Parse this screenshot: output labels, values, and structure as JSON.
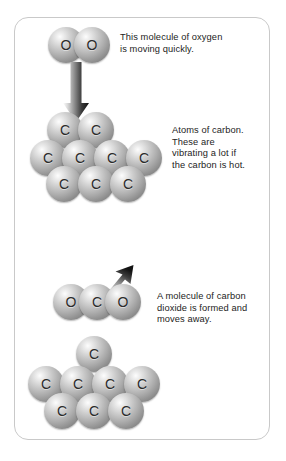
{
  "diagram": {
    "frame_color": "#c9c9c9",
    "background_color": "#ffffff",
    "atom_label_color": "#2b2b2b",
    "text_color": "#232323"
  },
  "captions": {
    "oxygen": "This molecule of oxygen\nis moving quickly.",
    "carbon": "Atoms of carbon.\nThese are\nvibrating a lot if\nthe carbon is hot.",
    "dioxide": "A molecule of carbon\ndioxide is formed and\nmoves away."
  },
  "labels": {
    "oxygen": "O",
    "carbon": "C"
  },
  "scene_top": {
    "name": "oxygen-approaching-carbon",
    "oxygen_molecule": {
      "name": "oxygen-molecule",
      "atoms": [
        {
          "label": "O",
          "x": 48,
          "y": 27,
          "d": 36
        },
        {
          "label": "O",
          "x": 74,
          "y": 27,
          "d": 36
        }
      ]
    },
    "arrow": {
      "name": "downward-motion-arrow",
      "direction": "down",
      "x": 67,
      "y": 64,
      "w": 22,
      "h": 58
    },
    "carbon_block": {
      "name": "carbon-lattice-top",
      "atom_count": 9,
      "rows": [
        {
          "row": "top",
          "atoms": [
            {
              "label": "C",
              "x": 47,
              "y": 112,
              "d": 36
            },
            {
              "label": "C",
              "x": 78,
              "y": 112,
              "d": 36
            }
          ]
        },
        {
          "row": "middle",
          "atoms": [
            {
              "label": "C",
              "x": 30,
              "y": 140,
              "d": 36
            },
            {
              "label": "C",
              "x": 62,
              "y": 140,
              "d": 36
            },
            {
              "label": "C",
              "x": 94,
              "y": 140,
              "d": 36
            },
            {
              "label": "C",
              "x": 126,
              "y": 140,
              "d": 36
            }
          ]
        },
        {
          "row": "bottom",
          "atoms": [
            {
              "label": "C",
              "x": 46,
              "y": 166,
              "d": 36
            },
            {
              "label": "C",
              "x": 78,
              "y": 166,
              "d": 36
            },
            {
              "label": "C",
              "x": 110,
              "y": 166,
              "d": 36
            }
          ]
        }
      ]
    }
  },
  "scene_bottom": {
    "name": "carbon-dioxide-leaving",
    "arrow": {
      "name": "away-motion-arrow",
      "direction": "up-right",
      "x": 105,
      "y": 266,
      "w": 30,
      "h": 28
    },
    "dioxide_molecule": {
      "name": "carbon-dioxide-molecule",
      "atoms": [
        {
          "label": "O",
          "x": 53,
          "y": 284,
          "d": 36
        },
        {
          "label": "C",
          "x": 79,
          "y": 284,
          "d": 36
        },
        {
          "label": "O",
          "x": 105,
          "y": 284,
          "d": 36
        }
      ]
    },
    "carbon_block": {
      "name": "carbon-lattice-bottom",
      "atom_count": 8,
      "rows": [
        {
          "row": "top",
          "atoms": [
            {
              "label": "C",
              "x": 76,
              "y": 336,
              "d": 36
            }
          ]
        },
        {
          "row": "middle",
          "atoms": [
            {
              "label": "C",
              "x": 28,
              "y": 366,
              "d": 36
            },
            {
              "label": "C",
              "x": 60,
              "y": 366,
              "d": 36
            },
            {
              "label": "C",
              "x": 92,
              "y": 366,
              "d": 36
            },
            {
              "label": "C",
              "x": 124,
              "y": 366,
              "d": 36
            }
          ]
        },
        {
          "row": "bottom",
          "atoms": [
            {
              "label": "C",
              "x": 44,
              "y": 393,
              "d": 36
            },
            {
              "label": "C",
              "x": 76,
              "y": 393,
              "d": 36
            },
            {
              "label": "C",
              "x": 108,
              "y": 393,
              "d": 36
            }
          ]
        }
      ]
    }
  }
}
